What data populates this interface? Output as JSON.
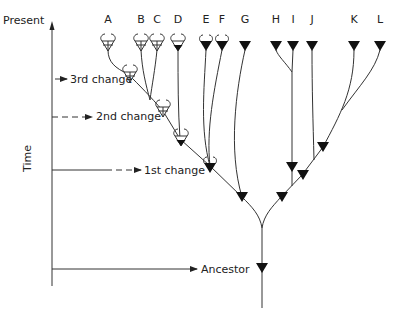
{
  "axis": {
    "top_label": "Present",
    "side_label": "Time"
  },
  "events": [
    {
      "label": "3rd change",
      "y": 79
    },
    {
      "label": "2nd change",
      "y": 117
    },
    {
      "label": "1st change",
      "y": 170
    },
    {
      "label": "Ancestor",
      "y": 269
    }
  ],
  "taxa": [
    {
      "label": "A",
      "x": 108,
      "symbol": "open-cross-horned"
    },
    {
      "label": "B",
      "x": 141,
      "symbol": "open-cross-horned"
    },
    {
      "label": "C",
      "x": 157,
      "symbol": "open-cross-horned"
    },
    {
      "label": "D",
      "x": 178,
      "symbol": "filled-horned"
    },
    {
      "label": "E",
      "x": 206,
      "symbol": "filled-horned"
    },
    {
      "label": "F",
      "x": 222,
      "symbol": "filled-horned"
    },
    {
      "label": "G",
      "x": 245,
      "symbol": "filled-triangle"
    },
    {
      "label": "H",
      "x": 276,
      "symbol": "filled-triangle"
    },
    {
      "label": "I",
      "x": 293,
      "symbol": "filled-triangle"
    },
    {
      "label": "J",
      "x": 312,
      "symbol": "filled-triangle"
    },
    {
      "label": "K",
      "x": 354,
      "symbol": "filled-triangle"
    },
    {
      "label": "L",
      "x": 380,
      "symbol": "filled-triangle"
    }
  ],
  "colors": {
    "line": "#333333",
    "fill": "#111111",
    "text": "#222222"
  }
}
